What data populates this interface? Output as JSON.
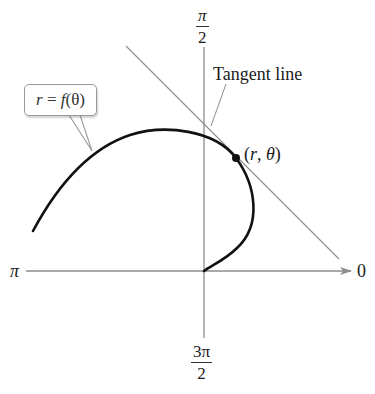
{
  "diagram": {
    "axis_labels": {
      "top": {
        "numerator": "π",
        "denominator": "2"
      },
      "bottom": {
        "numerator": "3π",
        "denominator": "2"
      },
      "left": "π",
      "right": "0"
    },
    "curve_label": {
      "r": "r",
      "equals": " = ",
      "f": "f",
      "arg": "(θ)"
    },
    "tangent_label": "Tangent line",
    "point_label": {
      "open": "(",
      "r": "r",
      "sep": ", ",
      "theta": "θ",
      "close": ")"
    },
    "colors": {
      "curve": "#111111",
      "axis": "#8c8c8c",
      "tangent": "#8c8c8c",
      "point": "#111111",
      "text": "#1a1a1a"
    }
  }
}
